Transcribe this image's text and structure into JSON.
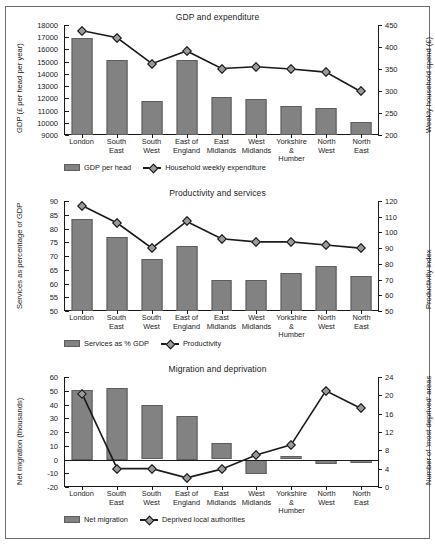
{
  "figure": {
    "categories": [
      "London",
      "South East",
      "South West",
      "East of England",
      "East Midlands",
      "West Midlands",
      "Yorkshire & Humber",
      "North West",
      "North East"
    ],
    "category_lines": [
      [
        "London",
        ""
      ],
      [
        "South",
        "East"
      ],
      [
        "South",
        "West"
      ],
      [
        "East of",
        "England"
      ],
      [
        "East",
        "Midlands"
      ],
      [
        "West",
        "Midlands"
      ],
      [
        "Yorkshire &",
        "Humber"
      ],
      [
        "North",
        "West"
      ],
      [
        "North",
        "East"
      ]
    ],
    "bar_color": "#828282",
    "line_color": "#1a1a1a",
    "marker_color": "#9a9a9a"
  },
  "chart_data": [
    {
      "type": "bar",
      "title": "GDP and expenditure",
      "xlabel": "",
      "ylabel": "GDP (£ per head per year)",
      "y2label": "Weekly household spend (£)",
      "categories": [
        "London",
        "South East",
        "South West",
        "East of England",
        "East Midlands",
        "West Midlands",
        "Yorkshire & Humber",
        "North West",
        "North East"
      ],
      "ylim": [
        9000,
        18000
      ],
      "yticks": [
        9000,
        10000,
        11000,
        12000,
        13000,
        14000,
        15000,
        16000,
        17000,
        18000
      ],
      "y2lim": [
        200,
        450
      ],
      "y2ticks": [
        200,
        250,
        300,
        350,
        400,
        450
      ],
      "grid": false,
      "legend_position": "bottom-left",
      "series": [
        {
          "name": "GDP per head",
          "type": "bar",
          "axis": "left",
          "values": [
            16900,
            15100,
            11800,
            15100,
            12150,
            11950,
            11400,
            11250,
            10050
          ]
        },
        {
          "name": "Household weekly expenditure",
          "type": "line",
          "axis": "right",
          "values": [
            437,
            421,
            362,
            391,
            351,
            355,
            350,
            343,
            299
          ]
        }
      ]
    },
    {
      "type": "bar",
      "title": "Productivity and services",
      "xlabel": "",
      "ylabel": "Services as percentage of GDP",
      "y2label": "Productivity index",
      "categories": [
        "London",
        "South East",
        "South West",
        "East of England",
        "East Midlands",
        "West Midlands",
        "Yorkshire & Humber",
        "North West",
        "North East"
      ],
      "ylim": [
        50,
        90
      ],
      "yticks": [
        50,
        55,
        60,
        65,
        70,
        75,
        80,
        85,
        90
      ],
      "y2lim": [
        50,
        120
      ],
      "y2ticks": [
        50,
        60,
        70,
        80,
        90,
        100,
        110,
        120
      ],
      "grid": false,
      "legend_position": "bottom-left",
      "series": [
        {
          "name": "Services as % GDP",
          "type": "bar",
          "axis": "left",
          "values": [
            83.5,
            77.0,
            69.0,
            73.5,
            61.4,
            61.2,
            63.7,
            66.2,
            62.8
          ]
        },
        {
          "name": "Productivity",
          "type": "line",
          "axis": "right",
          "values": [
            117,
            106,
            90,
            107,
            96,
            94,
            94,
            92,
            90
          ]
        }
      ]
    },
    {
      "type": "bar",
      "title": "Migration and deprivation",
      "xlabel": "",
      "ylabel": "Net migration (thousands)",
      "y2label": "Number of 'most deprived' areas",
      "categories": [
        "London",
        "South East",
        "South West",
        "East of England",
        "East Midlands",
        "West Midlands",
        "Yorkshire & Humber",
        "North West",
        "North East"
      ],
      "ylim": [
        -20,
        60
      ],
      "yticks": [
        -20,
        -10,
        0,
        10,
        20,
        30,
        40,
        50,
        60
      ],
      "y2lim": [
        0,
        24
      ],
      "y2ticks": [
        0,
        4,
        8,
        12,
        16,
        20,
        24
      ],
      "grid": false,
      "legend_position": "bottom-left",
      "series": [
        {
          "name": "Net migration",
          "type": "bar",
          "axis": "left",
          "values": [
            50.5,
            52.0,
            39.8,
            32.0,
            12.2,
            -10.5,
            2.4,
            -3.5,
            -2.4
          ]
        },
        {
          "name": "Deprived local authorities",
          "type": "line",
          "axis": "right",
          "values": [
            20.2,
            4.0,
            4.0,
            2.0,
            3.9,
            7.0,
            9.2,
            21.0,
            17.2
          ]
        }
      ]
    }
  ]
}
